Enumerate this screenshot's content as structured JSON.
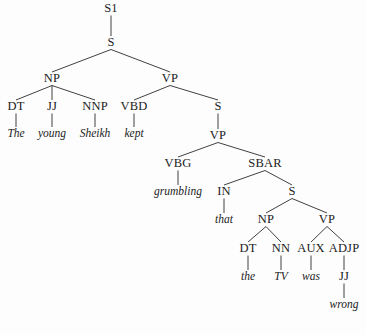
{
  "figure": {
    "kind": "constituency-parse-tree",
    "sentence": "The young Sheikh kept grumbling that the TV was wrong",
    "background_color": "#fdfdfd",
    "ink_color": "#1c1c1c",
    "edge_color": "#2b2b2b"
  },
  "nodes": [
    {
      "id": "n0",
      "label": "S1",
      "kind": "nonterminal",
      "x": 111,
      "y": 12
    },
    {
      "id": "n1",
      "label": "S",
      "kind": "nonterminal",
      "x": 111,
      "y": 46
    },
    {
      "id": "n2",
      "label": "NP",
      "kind": "nonterminal",
      "x": 52,
      "y": 82
    },
    {
      "id": "n3",
      "label": "VP",
      "kind": "nonterminal",
      "x": 170,
      "y": 82
    },
    {
      "id": "n4",
      "label": "DT",
      "kind": "preterminal",
      "x": 16,
      "y": 110
    },
    {
      "id": "n5",
      "label": "JJ",
      "kind": "preterminal",
      "x": 52,
      "y": 110
    },
    {
      "id": "n6",
      "label": "NNP",
      "kind": "preterminal",
      "x": 95,
      "y": 110
    },
    {
      "id": "n7",
      "label": "VBD",
      "kind": "preterminal",
      "x": 134,
      "y": 110
    },
    {
      "id": "n8",
      "label": "The",
      "kind": "terminal",
      "x": 16,
      "y": 137
    },
    {
      "id": "n9",
      "label": "young",
      "kind": "terminal",
      "x": 52,
      "y": 137
    },
    {
      "id": "n10",
      "label": "Sheikh",
      "kind": "terminal",
      "x": 95,
      "y": 137
    },
    {
      "id": "n11",
      "label": "kept",
      "kind": "terminal",
      "x": 134,
      "y": 137
    },
    {
      "id": "n12",
      "label": "S",
      "kind": "nonterminal",
      "x": 218,
      "y": 110
    },
    {
      "id": "n13",
      "label": "VP",
      "kind": "nonterminal",
      "x": 218,
      "y": 139
    },
    {
      "id": "n14",
      "label": "VBG",
      "kind": "preterminal",
      "x": 178,
      "y": 167
    },
    {
      "id": "n15",
      "label": "SBAR",
      "kind": "nonterminal",
      "x": 265,
      "y": 167
    },
    {
      "id": "n16",
      "label": "grumbling",
      "kind": "terminal",
      "x": 178,
      "y": 195
    },
    {
      "id": "n17",
      "label": "IN",
      "kind": "preterminal",
      "x": 224,
      "y": 195
    },
    {
      "id": "n18",
      "label": "S",
      "kind": "nonterminal",
      "x": 292,
      "y": 195
    },
    {
      "id": "n19",
      "label": "that",
      "kind": "terminal",
      "x": 224,
      "y": 223
    },
    {
      "id": "n20",
      "label": "NP",
      "kind": "nonterminal",
      "x": 266,
      "y": 223
    },
    {
      "id": "n21",
      "label": "VP",
      "kind": "nonterminal",
      "x": 327,
      "y": 223
    },
    {
      "id": "n22",
      "label": "DT",
      "kind": "preterminal",
      "x": 248,
      "y": 252
    },
    {
      "id": "n23",
      "label": "NN",
      "kind": "preterminal",
      "x": 281,
      "y": 252
    },
    {
      "id": "n24",
      "label": "AUX",
      "kind": "preterminal",
      "x": 311,
      "y": 252
    },
    {
      "id": "n25",
      "label": "ADJP",
      "kind": "nonterminal",
      "x": 344,
      "y": 252
    },
    {
      "id": "n26",
      "label": "the",
      "kind": "terminal",
      "x": 248,
      "y": 280
    },
    {
      "id": "n27",
      "label": "TV",
      "kind": "terminal",
      "x": 281,
      "y": 280
    },
    {
      "id": "n28",
      "label": "was",
      "kind": "terminal",
      "x": 311,
      "y": 280
    },
    {
      "id": "n29",
      "label": "JJ",
      "kind": "preterminal",
      "x": 344,
      "y": 280
    },
    {
      "id": "n30",
      "label": "wrong",
      "kind": "terminal",
      "x": 344,
      "y": 308
    }
  ],
  "edges": [
    {
      "from": "n0",
      "to": "n1"
    },
    {
      "from": "n1",
      "to": "n2"
    },
    {
      "from": "n1",
      "to": "n3"
    },
    {
      "from": "n2",
      "to": "n4"
    },
    {
      "from": "n2",
      "to": "n5"
    },
    {
      "from": "n2",
      "to": "n6"
    },
    {
      "from": "n3",
      "to": "n7"
    },
    {
      "from": "n3",
      "to": "n12"
    },
    {
      "from": "n4",
      "to": "n8"
    },
    {
      "from": "n5",
      "to": "n9"
    },
    {
      "from": "n6",
      "to": "n10"
    },
    {
      "from": "n7",
      "to": "n11"
    },
    {
      "from": "n12",
      "to": "n13"
    },
    {
      "from": "n13",
      "to": "n14"
    },
    {
      "from": "n13",
      "to": "n15"
    },
    {
      "from": "n14",
      "to": "n16"
    },
    {
      "from": "n15",
      "to": "n17"
    },
    {
      "from": "n15",
      "to": "n18"
    },
    {
      "from": "n17",
      "to": "n19"
    },
    {
      "from": "n18",
      "to": "n20"
    },
    {
      "from": "n18",
      "to": "n21"
    },
    {
      "from": "n20",
      "to": "n22"
    },
    {
      "from": "n20",
      "to": "n23"
    },
    {
      "from": "n21",
      "to": "n24"
    },
    {
      "from": "n21",
      "to": "n25"
    },
    {
      "from": "n22",
      "to": "n26"
    },
    {
      "from": "n23",
      "to": "n27"
    },
    {
      "from": "n24",
      "to": "n28"
    },
    {
      "from": "n25",
      "to": "n29"
    },
    {
      "from": "n29",
      "to": "n30"
    }
  ]
}
